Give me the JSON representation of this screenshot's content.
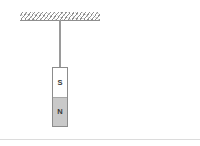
{
  "diagram": {
    "background_color": "#ffffff",
    "ceiling": {
      "name": "ceiling-support",
      "label": "",
      "hatch_color": "#787878",
      "edge_color": "#8f8f8f"
    },
    "string": {
      "name": "suspension-string",
      "label": "",
      "color": "#9a9a9a"
    },
    "magnet": {
      "name": "bar-magnet",
      "border_color": "#8c8c8c",
      "poles": [
        {
          "id": "south",
          "label": "S",
          "fill_color": "#ffffff",
          "text_color": "#3a3a3a"
        },
        {
          "id": "north",
          "label": "N",
          "fill_color": "#c9c9c9",
          "text_color": "#3a3a3a"
        }
      ]
    },
    "divider": {
      "name": "bottom-divider",
      "color": "#dcdcdc"
    }
  }
}
